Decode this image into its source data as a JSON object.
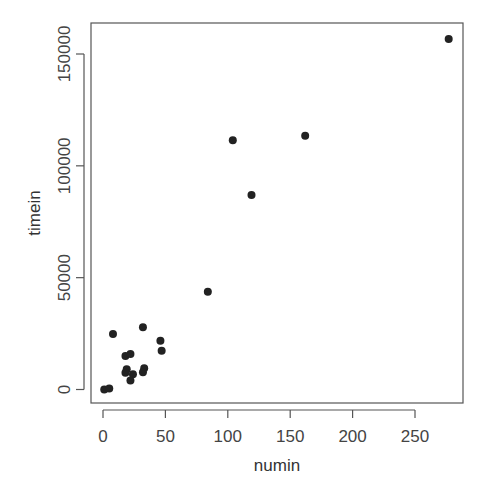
{
  "chart_data": {
    "type": "scatter",
    "title": "",
    "xlabel": "numin",
    "ylabel": "timein",
    "xlim": [
      -9,
      289
    ],
    "ylim": [
      -6000,
      163000
    ],
    "xticks": [
      0,
      50,
      100,
      150,
      200,
      250
    ],
    "xtick_labels": [
      "0",
      "50",
      "100",
      "150",
      "200",
      "250"
    ],
    "yticks": [
      0,
      50000,
      100000,
      150000
    ],
    "ytick_labels": [
      "0",
      "50000",
      "100000",
      "150000"
    ],
    "grid": false,
    "legend": null,
    "marker_color": "#222222",
    "points": [
      {
        "x": 1,
        "y": 0
      },
      {
        "x": 5,
        "y": 500
      },
      {
        "x": 8,
        "y": 24800
      },
      {
        "x": 32,
        "y": 27800
      },
      {
        "x": 46,
        "y": 21800
      },
      {
        "x": 47,
        "y": 17300
      },
      {
        "x": 18,
        "y": 15000
      },
      {
        "x": 22,
        "y": 15900
      },
      {
        "x": 19,
        "y": 9000
      },
      {
        "x": 18,
        "y": 7500
      },
      {
        "x": 24,
        "y": 6800
      },
      {
        "x": 22,
        "y": 4000
      },
      {
        "x": 33,
        "y": 9500
      },
      {
        "x": 32,
        "y": 7700
      },
      {
        "x": 84,
        "y": 43700
      },
      {
        "x": 104,
        "y": 111400
      },
      {
        "x": 119,
        "y": 87000
      },
      {
        "x": 162,
        "y": 113500
      },
      {
        "x": 277,
        "y": 156700
      }
    ]
  }
}
